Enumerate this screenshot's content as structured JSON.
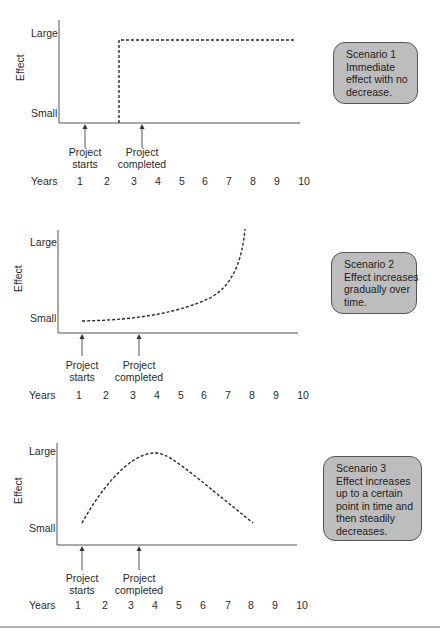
{
  "panels": [
    {
      "y_label": "Effect",
      "y_ticks": [
        "Large",
        "Small"
      ],
      "markers": [
        {
          "label_line1": "Project",
          "label_line2": "starts"
        },
        {
          "label_line1": "Project",
          "label_line2": "completed"
        }
      ],
      "x_axis_title": "Years",
      "x_ticks": [
        "1",
        "2",
        "3",
        "4",
        "5",
        "6",
        "7",
        "8",
        "9",
        "10"
      ],
      "callout": {
        "title": "Scenario 1",
        "lines": [
          "Immediate",
          "effect with no",
          "decrease."
        ]
      }
    },
    {
      "y_label": "Effect",
      "y_ticks": [
        "Large",
        "Small"
      ],
      "markers": [
        {
          "label_line1": "Project",
          "label_line2": "starts"
        },
        {
          "label_line1": "Project",
          "label_line2": "completed"
        }
      ],
      "x_axis_title": "Years",
      "x_ticks": [
        "1",
        "2",
        "3",
        "4",
        "5",
        "6",
        "7",
        "8",
        "9",
        "10"
      ],
      "callout": {
        "title": "Scenario 2",
        "lines": [
          "Effect increases",
          "gradually over",
          "time."
        ]
      }
    },
    {
      "y_label": "Effect",
      "y_ticks": [
        "Large",
        "Small"
      ],
      "markers": [
        {
          "label_line1": "Project",
          "label_line2": "starts"
        },
        {
          "label_line1": "Project",
          "label_line2": "completed"
        }
      ],
      "x_axis_title": "Years",
      "x_ticks": [
        "1",
        "2",
        "3",
        "4",
        "5",
        "6",
        "7",
        "8",
        "9",
        "10"
      ],
      "callout": {
        "title": "Scenario 3",
        "lines": [
          "Effect increases",
          "up to a certain",
          "point in time and",
          "then steadily",
          "decreases."
        ]
      }
    }
  ],
  "colors": {
    "line": "#2a2a2a",
    "axis": "#555555",
    "callout_fill": "#bdbdbd",
    "callout_border": "#555555"
  }
}
